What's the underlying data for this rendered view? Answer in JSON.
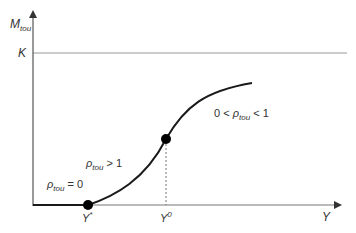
{
  "diagram": {
    "y_axis_label": "M",
    "y_axis_label_sub": "tou",
    "x_axis_label": "Y",
    "k_label": "K",
    "points": [
      {
        "label": "Y",
        "sup": "*"
      },
      {
        "label": "Y",
        "sup": "0"
      }
    ],
    "regions": [
      {
        "prefix": "",
        "symbol": "ρ",
        "sub": "tou",
        "suffix": " = 0"
      },
      {
        "prefix": "",
        "symbol": "ρ",
        "sub": "tou",
        "suffix": " > 1"
      },
      {
        "prefix": "0 < ",
        "symbol": "ρ",
        "sub": "tou",
        "suffix": " < 1"
      }
    ],
    "colors": {
      "axis": "#555555",
      "k_line": "#999999",
      "curve": "#1a1a1a",
      "dot": "#000000",
      "dashed": "#777777",
      "text": "#333333"
    }
  }
}
